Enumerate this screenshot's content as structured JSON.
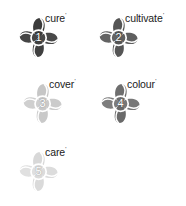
{
  "figure": {
    "background_color": "#ffffff",
    "title": "",
    "clusters": [
      {
        "number": "1",
        "label": "cure",
        "superscript": "ʹ",
        "tone": "very-dark",
        "petal_colors": {
          "top": "#3b3b3b",
          "right": "#4a4a4a",
          "bottom": "#3f3f3f",
          "left": "#454545"
        },
        "ring_color": "#ffffff",
        "x": 18,
        "y": 12
      },
      {
        "number": "2",
        "label": "cultivate",
        "superscript": "ʹ",
        "tone": "dark",
        "petal_colors": {
          "top": "#545454",
          "right": "#5f5f5f",
          "bottom": "#565656",
          "left": "#636363"
        },
        "ring_color": "#ffffff",
        "x": 98,
        "y": 12
      },
      {
        "number": "3",
        "label": "cover",
        "superscript": "ʹ",
        "tone": "very-light",
        "petal_colors": {
          "top": "#c6c6c6",
          "right": "#cbcbcb",
          "bottom": "#c9c9c9",
          "left": "#cfcfcf"
        },
        "ring_color": "#ffffff",
        "x": 22,
        "y": 78
      },
      {
        "number": "4",
        "label": "colour",
        "superscript": "ʹ",
        "tone": "medium",
        "petal_colors": {
          "top": "#6e6e6e",
          "right": "#777777",
          "bottom": "#6a6a6a",
          "left": "#7d7d7d"
        },
        "ring_color": "#ffffff",
        "x": 100,
        "y": 78
      },
      {
        "number": "5",
        "label": "care",
        "superscript": "ʹ",
        "tone": "lightest",
        "petal_colors": {
          "top": "#d8d8d8",
          "right": "#dcdcdc",
          "bottom": "#dadada",
          "left": "#e0e0e0"
        },
        "ring_color": "#ffffff",
        "x": 18,
        "y": 146
      }
    ]
  }
}
